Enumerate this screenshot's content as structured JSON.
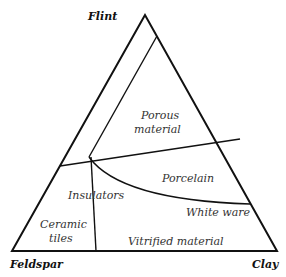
{
  "vertices": {
    "top": "Flint",
    "bottom_left": "Feldspar",
    "bottom_right": "Clay"
  },
  "regions": {
    "porous_1": "Porous",
    "porous_2": "material",
    "porcelain": "Porcelain",
    "insulators": "Insulators",
    "white_ware": "White ware",
    "ceramic_1": "Ceramic",
    "ceramic_2": "tiles",
    "vitrified": "Vitrified material"
  },
  "colors": {
    "line": "#111111",
    "text": "#333333"
  }
}
